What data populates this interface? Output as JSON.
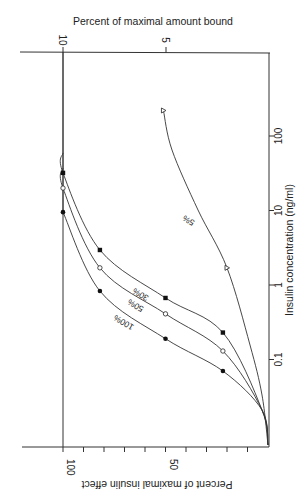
{
  "chart_data": {
    "type": "line",
    "orientation": "rotated 90 degrees (x-axis vertical on right, y-axis horizontal on bottom)",
    "title": "",
    "xlabel": "Insulin concentration (ng/ml)",
    "ylabel": "Percent of maximal insulin effect",
    "y2label": "Percent of maximal amount bound",
    "xscale": "log",
    "x_ticks": [
      0.1,
      1,
      10,
      100
    ],
    "x_tick_labels": [
      "0.1",
      "1",
      "10",
      "100"
    ],
    "y_ticks": [
      0,
      10,
      20,
      30,
      40,
      50,
      60,
      70,
      80,
      90,
      100
    ],
    "y_tick_labels": {
      "50": "50",
      "100": "100"
    },
    "ylim": [
      0,
      110
    ],
    "y2_ticks": [
      5,
      10
    ],
    "y2_tick_labels": [
      "5",
      "10"
    ],
    "grid": false,
    "legend": "inline curve labels",
    "series": [
      {
        "name": "100%",
        "marker": "filled-circle",
        "x": [
          0.07,
          0.19,
          0.83,
          9.5
        ],
        "y": [
          22,
          50,
          82,
          100
        ]
      },
      {
        "name": "50%",
        "marker": "open-circle",
        "x": [
          0.13,
          0.41,
          1.7,
          20
        ],
        "y": [
          22,
          50,
          82,
          100
        ]
      },
      {
        "name": "30%",
        "marker": "filled-square",
        "x": [
          0.23,
          0.67,
          2.95,
          32
        ],
        "y": [
          22,
          50,
          82,
          100
        ]
      },
      {
        "name": "5%",
        "marker": "open-triangle",
        "x": [
          1.7,
          220
        ],
        "y": [
          20,
          51
        ]
      }
    ]
  },
  "labels": {
    "top_axis_title": "Percent of maximal amount bound",
    "right_axis_title": "Insulin concentration (ng/ml)",
    "bottom_axis_title": "Percent of maximal insulin effect"
  }
}
